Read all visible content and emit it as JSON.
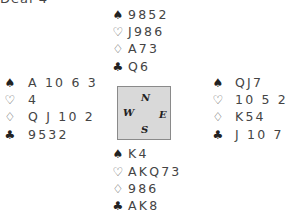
{
  "header_fragment": "Deal 4",
  "compass": {
    "north": "N",
    "south": "S",
    "east": "E",
    "west": "W"
  },
  "hands": {
    "north": {
      "spades": "9852",
      "hearts": "J986",
      "diamonds": "A73",
      "clubs": "Q6"
    },
    "west": {
      "spades": "A 10 6 3",
      "hearts": "4",
      "diamonds": "Q J 10 2",
      "clubs": "9532"
    },
    "east": {
      "spades": "QJ7",
      "hearts": "10 5 2",
      "diamonds": "K54",
      "clubs": "J 10 7 4"
    },
    "south": {
      "spades": "K4",
      "hearts": "AKQ73",
      "diamonds": "986",
      "clubs": "AK8"
    }
  },
  "suit_symbols": {
    "spades": "♠",
    "hearts": "♡",
    "diamonds": "♢",
    "clubs": "♣"
  }
}
